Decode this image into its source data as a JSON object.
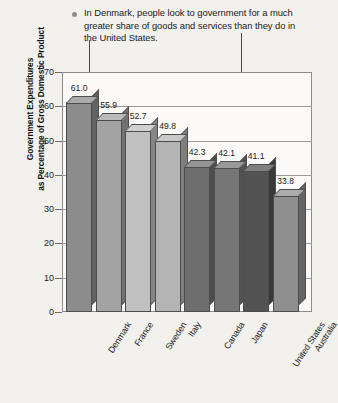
{
  "caption": {
    "bullet_icon": "bullet-dot-icon",
    "text": "In Denmark, people look to government for a much greater share of goods and services than they do in the United States."
  },
  "annotations": [
    {
      "name": "denmark-pointer",
      "target": "Denmark"
    },
    {
      "name": "united-states-pointer",
      "target": "United States"
    }
  ],
  "chart_data": {
    "type": "bar",
    "title": "",
    "xlabel": "",
    "ylabel_line1": "Government Expenditures",
    "ylabel_line2": "as Percentage of Gross Domestic Product",
    "categories": [
      "Denmark",
      "France",
      "Sweden",
      "Italy",
      "Canada",
      "Japan",
      "United States",
      "Australia"
    ],
    "values": [
      61.0,
      55.9,
      52.7,
      49.8,
      42.3,
      42.1,
      41.1,
      33.8
    ],
    "value_labels": [
      "61.0",
      "55.9",
      "52.7",
      "49.8",
      "42.3",
      "42.1",
      "41.1",
      "33.8"
    ],
    "bar_colors": [
      "#8c8c8c",
      "#a2a2a2",
      "#c0c0c0",
      "#b4b4b4",
      "#6e6e6e",
      "#757575",
      "#525252",
      "#8f8f8f"
    ],
    "ylim": [
      0,
      70
    ],
    "yticks": [
      0,
      10,
      20,
      30,
      40,
      50,
      60,
      70
    ],
    "ytick_labels": [
      "0",
      "10",
      "20",
      "30",
      "40",
      "50",
      "60",
      "70"
    ],
    "grid": true,
    "legend": "none"
  }
}
